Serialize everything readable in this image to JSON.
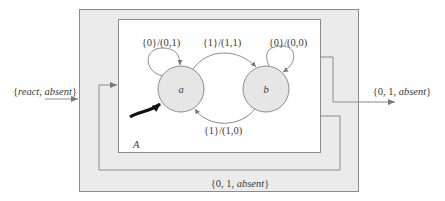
{
  "diagram": {
    "composite_block": {
      "fill": "#ebebeb",
      "stroke": "#8c8c8c"
    },
    "inner_block": {
      "name": "A",
      "fill": "#ffffff",
      "stroke": "#8c8c8c"
    },
    "input": {
      "prefix": "{",
      "italic_text": "react, absent",
      "suffix": "}"
    },
    "output": {
      "prefix": "{0, 1, ",
      "italic_text": "absent",
      "suffix": "}"
    },
    "feedback": {
      "prefix": "{0, 1, ",
      "italic_text": "absent",
      "suffix": "}"
    },
    "states": [
      {
        "id": "a",
        "label": "a",
        "initial": true,
        "fill": "#e6e6e6"
      },
      {
        "id": "b",
        "label": "b",
        "initial": false,
        "fill": "#e6e6e6"
      }
    ],
    "transitions": [
      {
        "from": "a",
        "to": "a",
        "label": "{0}/(0,1)"
      },
      {
        "from": "a",
        "to": "b",
        "label": "{1}/(1,1)"
      },
      {
        "from": "b",
        "to": "b",
        "label": "{0}/(0,0)"
      },
      {
        "from": "b",
        "to": "a",
        "label": "{1}/(1,0)"
      }
    ]
  }
}
